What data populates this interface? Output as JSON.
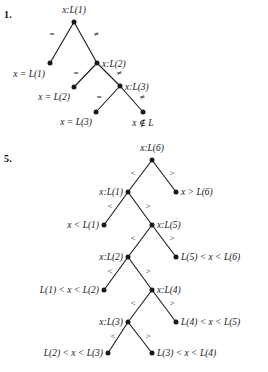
{
  "page": {
    "background": "#ffffff",
    "ink": "#1a1a1a"
  },
  "problems": [
    {
      "number": "1.",
      "number_pos": {
        "x": 4,
        "y": 9
      },
      "type": "decision-tree",
      "description": "Sequential search comparison tree on list L of 3 elements",
      "nodes": [
        {
          "id": "n1",
          "label": "x:L(1)",
          "x": 74,
          "y": 22,
          "label_side": "above",
          "label_x": 74,
          "label_y": 10,
          "kind": "internal"
        },
        {
          "id": "n2",
          "label": "x = L(1)",
          "x": 50,
          "y": 63,
          "label_side": "left",
          "label_x": 45,
          "label_y": 74,
          "kind": "leaf"
        },
        {
          "id": "n3",
          "label": "x:L(2)",
          "x": 97,
          "y": 63,
          "label_side": "right",
          "label_x": 102,
          "label_y": 64,
          "kind": "internal"
        },
        {
          "id": "n4",
          "label": "x = L(2)",
          "x": 74,
          "y": 87,
          "label_side": "left",
          "label_x": 70,
          "label_y": 97,
          "kind": "leaf"
        },
        {
          "id": "n5",
          "label": "x:L(3)",
          "x": 120,
          "y": 86,
          "label_side": "right",
          "label_x": 125,
          "label_y": 87,
          "kind": "internal"
        },
        {
          "id": "n6",
          "label": "x = L(3)",
          "x": 96,
          "y": 112,
          "label_side": "left",
          "label_x": 92,
          "label_y": 122,
          "kind": "leaf"
        },
        {
          "id": "n7",
          "label": "x ∉ L",
          "x": 143,
          "y": 112,
          "label_side": "below",
          "label_x": 143,
          "label_y": 122,
          "kind": "leaf"
        }
      ],
      "edges": [
        {
          "from": "n1",
          "to": "n2",
          "label": "=",
          "label_x": 52,
          "label_y": 34
        },
        {
          "from": "n1",
          "to": "n3",
          "label": "≠",
          "label_x": 96,
          "label_y": 34
        },
        {
          "from": "n3",
          "to": "n4",
          "label": "=",
          "label_x": 76,
          "label_y": 73
        },
        {
          "from": "n3",
          "to": "n5",
          "label": "≠",
          "label_x": 119,
          "label_y": 73
        },
        {
          "from": "n5",
          "to": "n6",
          "label": "=",
          "label_x": 99,
          "label_y": 97
        },
        {
          "from": "n5",
          "to": "n7",
          "label": "≠",
          "label_x": 142,
          "label_y": 97
        }
      ]
    },
    {
      "number": "5.",
      "number_pos": {
        "x": 4,
        "y": 153
      },
      "type": "decision-tree",
      "description": "Binary comparison tree for searching a sorted list L of 6 elements",
      "nodes": [
        {
          "id": "m1",
          "label": "x:L(6)",
          "x": 152,
          "y": 160,
          "label_side": "above",
          "label_x": 152,
          "label_y": 148,
          "kind": "internal"
        },
        {
          "id": "m2",
          "label": "x:L(1)",
          "x": 128,
          "y": 192,
          "label_side": "left",
          "label_x": 123,
          "label_y": 192,
          "kind": "internal"
        },
        {
          "id": "m3",
          "label": "x > L(6)",
          "x": 176,
          "y": 192,
          "label_side": "right",
          "label_x": 181,
          "label_y": 192,
          "kind": "leaf"
        },
        {
          "id": "m4",
          "label": "x < L(1)",
          "x": 104,
          "y": 225,
          "label_side": "left",
          "label_x": 99,
          "label_y": 225,
          "kind": "leaf"
        },
        {
          "id": "m5",
          "label": "x:L(5)",
          "x": 152,
          "y": 225,
          "label_side": "right",
          "label_x": 157,
          "label_y": 225,
          "kind": "internal"
        },
        {
          "id": "m6",
          "label": "x:L(2)",
          "x": 128,
          "y": 257,
          "label_side": "left",
          "label_x": 123,
          "label_y": 257,
          "kind": "internal"
        },
        {
          "id": "m7",
          "label": "L(5) < x < L(6)",
          "x": 176,
          "y": 257,
          "label_side": "right",
          "label_x": 181,
          "label_y": 257,
          "kind": "leaf"
        },
        {
          "id": "m8",
          "label": "L(1) < x < L(2)",
          "x": 104,
          "y": 290,
          "label_side": "left",
          "label_x": 99,
          "label_y": 290,
          "kind": "leaf"
        },
        {
          "id": "m9",
          "label": "x:L(4)",
          "x": 152,
          "y": 290,
          "label_side": "right",
          "label_x": 157,
          "label_y": 290,
          "kind": "internal"
        },
        {
          "id": "m10",
          "label": "x:L(3)",
          "x": 128,
          "y": 322,
          "label_side": "left",
          "label_x": 123,
          "label_y": 322,
          "kind": "internal"
        },
        {
          "id": "m11",
          "label": "L(4) < x < L(5)",
          "x": 176,
          "y": 322,
          "label_side": "right",
          "label_x": 181,
          "label_y": 322,
          "kind": "leaf"
        },
        {
          "id": "m12",
          "label": "L(2) < x < L(3)",
          "x": 108,
          "y": 353,
          "label_side": "left",
          "label_x": 103,
          "label_y": 353,
          "kind": "leaf"
        },
        {
          "id": "m13",
          "label": "L(3) < x < L(4)",
          "x": 152,
          "y": 353,
          "label_side": "right",
          "label_x": 157,
          "label_y": 353,
          "kind": "leaf"
        }
      ],
      "edges": [
        {
          "from": "m1",
          "to": "m2",
          "label": "<",
          "label_x": 133,
          "label_y": 173
        },
        {
          "from": "m1",
          "to": "m3",
          "label": ">",
          "label_x": 172,
          "label_y": 173
        },
        {
          "from": "m2",
          "to": "m4",
          "label": "<",
          "label_x": 110,
          "label_y": 206
        },
        {
          "from": "m2",
          "to": "m5",
          "label": ">",
          "label_x": 148,
          "label_y": 206
        },
        {
          "from": "m5",
          "to": "m6",
          "label": "<",
          "label_x": 133,
          "label_y": 238
        },
        {
          "from": "m5",
          "to": "m7",
          "label": ">",
          "label_x": 172,
          "label_y": 238
        },
        {
          "from": "m6",
          "to": "m8",
          "label": "<",
          "label_x": 110,
          "label_y": 271
        },
        {
          "from": "m6",
          "to": "m9",
          "label": ">",
          "label_x": 148,
          "label_y": 271
        },
        {
          "from": "m9",
          "to": "m10",
          "label": "<",
          "label_x": 133,
          "label_y": 303
        },
        {
          "from": "m9",
          "to": "m11",
          "label": ">",
          "label_x": 172,
          "label_y": 303
        },
        {
          "from": "m10",
          "to": "m12",
          "label": "<",
          "label_x": 113,
          "label_y": 336
        },
        {
          "from": "m10",
          "to": "m13",
          "label": ">",
          "label_x": 148,
          "label_y": 336
        }
      ]
    }
  ]
}
